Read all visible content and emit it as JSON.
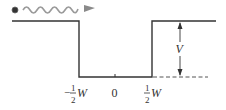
{
  "diagram": {
    "type": "square-well-potential",
    "colors": {
      "line": "#333333",
      "wave": "#9a9a9a",
      "particle": "#333333",
      "dashed": "#555555"
    },
    "particle": {
      "icon": "incoming-particle-wave"
    },
    "labels": {
      "left_edge": {
        "sign": "−",
        "num": "1",
        "den": "2",
        "var": "W"
      },
      "center": "0",
      "right_edge": {
        "num": "1",
        "den": "2",
        "var": "W"
      },
      "height": "V"
    }
  }
}
